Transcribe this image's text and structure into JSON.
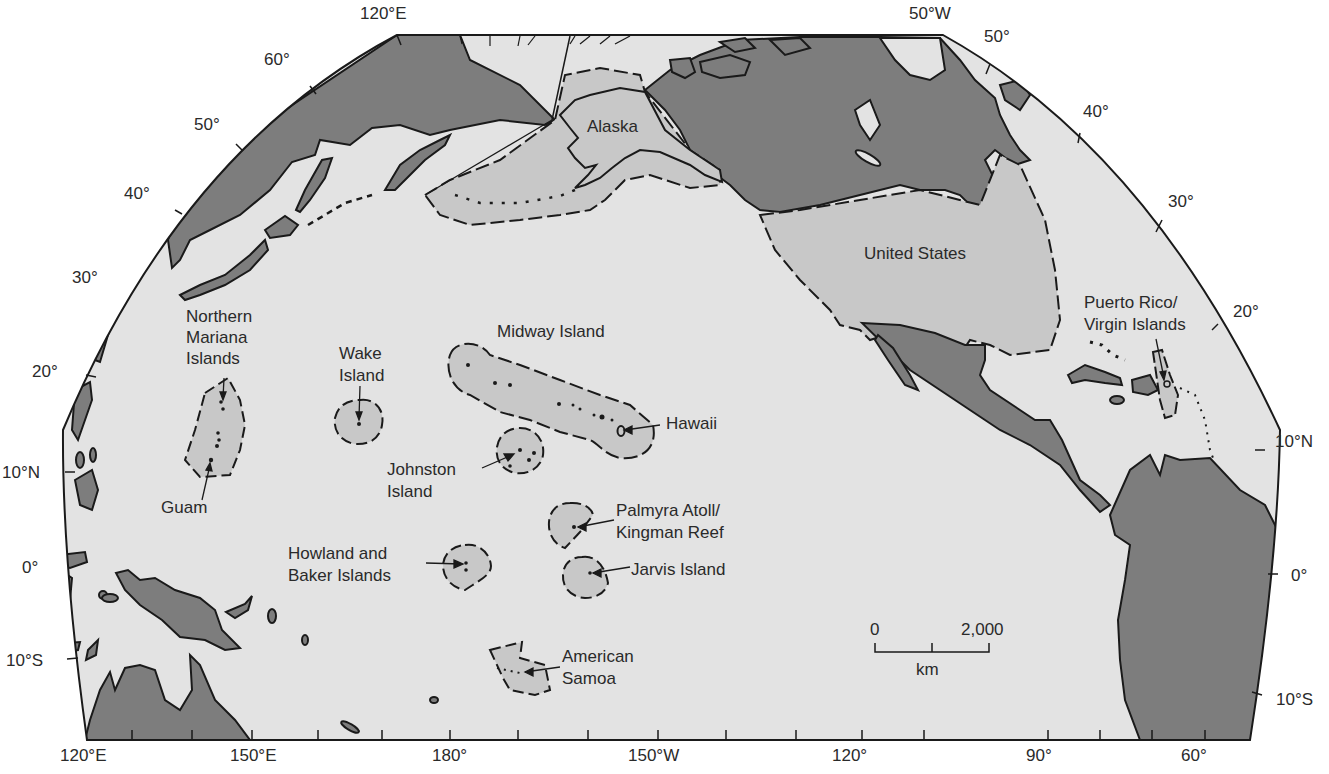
{
  "map": {
    "colors": {
      "ocean": "#e3e3e3",
      "foreign_land": "#7d7d7d",
      "us_territory": "#c8c8c8",
      "outline": "#1a1a1a",
      "background": "#ffffff"
    },
    "regions": {
      "alaska": "Alaska",
      "united_states": "United States",
      "northern_mariana": [
        "Northern",
        "Mariana",
        "Islands"
      ],
      "guam": "Guam",
      "wake": [
        "Wake",
        "Island"
      ],
      "midway": "Midway Island",
      "hawaii": "Hawaii",
      "johnston": [
        "Johnston",
        "Island"
      ],
      "palmyra": [
        "Palmyra Atoll/",
        "Kingman Reef"
      ],
      "howland_baker": [
        "Howland and",
        "Baker Islands"
      ],
      "jarvis": "Jarvis Island",
      "american_samoa": [
        "American",
        "Samoa"
      ],
      "puerto_rico": [
        "Puerto Rico/",
        "Virgin Islands"
      ]
    },
    "graticule": {
      "top": [
        "120°E",
        "50°W"
      ],
      "left": [
        "60°",
        "50°",
        "40°",
        "30°",
        "20°",
        "10°N",
        "0°",
        "10°S"
      ],
      "right": [
        "50°",
        "40°",
        "30°",
        "20°",
        "10°N",
        "0°",
        "10°S"
      ],
      "bottom": [
        "120°E",
        "150°E",
        "180°",
        "150°W",
        "120°",
        "90°",
        "60°"
      ]
    },
    "scale_bar": {
      "start": "0",
      "end": "2,000",
      "unit": "km"
    }
  }
}
